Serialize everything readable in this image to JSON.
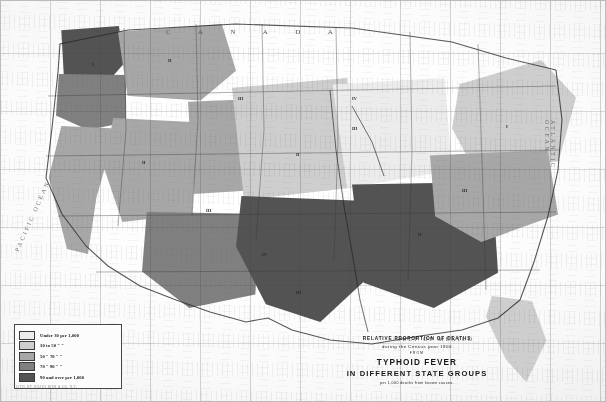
{
  "figure": {
    "kind": "choropleth-map",
    "region": "United States"
  },
  "title_block": {
    "line_relative": "RELATIVE PROPORTION OF DEATHS",
    "line_year": "during the Census year 1900",
    "line_from": "FROM",
    "disease": "TYPHOID FEVER",
    "subtitle": "IN DIFFERENT STATE GROUPS",
    "rate_note": "per 1,000 deaths from known causes."
  },
  "legend": {
    "items": [
      {
        "label": "Under 30 per 1,000",
        "color": "#eceae5"
      },
      {
        "label": "30 to 50    \"      \"",
        "color": "#cfccc5"
      },
      {
        "label": "50 \"  70    \"      \"",
        "color": "#aaa69e"
      },
      {
        "label": "70 \"  90    \"      \"",
        "color": "#84807a"
      },
      {
        "label": "90 and over per 1,000",
        "color": "#575450"
      }
    ]
  },
  "map_labels": {
    "canada": "C A N A D A",
    "atlantic": "ATLANTIC OCEAN",
    "pacific": "PACIFIC OCEAN",
    "gulf": "GULF OF MEXICO"
  },
  "state_groups": [
    {
      "numeral": "I",
      "x": 92,
      "y": 62
    },
    {
      "numeral": "II",
      "x": 168,
      "y": 58
    },
    {
      "numeral": "III",
      "x": 238,
      "y": 96
    },
    {
      "numeral": "IV",
      "x": 352,
      "y": 96
    },
    {
      "numeral": "III",
      "x": 352,
      "y": 126
    },
    {
      "numeral": "II",
      "x": 296,
      "y": 152
    },
    {
      "numeral": "II",
      "x": 142,
      "y": 160
    },
    {
      "numeral": "III",
      "x": 206,
      "y": 208
    },
    {
      "numeral": "IV",
      "x": 262,
      "y": 252
    },
    {
      "numeral": "III",
      "x": 296,
      "y": 290
    },
    {
      "numeral": "II",
      "x": 418,
      "y": 232
    },
    {
      "numeral": "III",
      "x": 462,
      "y": 188
    },
    {
      "numeral": "I",
      "x": 506,
      "y": 124
    }
  ],
  "imprint": "LITH. BY JULIUS BIEN & CO. N.Y.",
  "colors": {
    "class_1": "#eceae5",
    "class_2": "#cfccc5",
    "class_3": "#aaa69e",
    "class_4": "#84807a",
    "class_5": "#575450",
    "ink": "#1b1a19",
    "paper": "#f7f6f3"
  },
  "chart_data": {
    "type": "map",
    "title": "TYPHOID FEVER IN DIFFERENT STATE GROUPS",
    "subtitle": "RELATIVE PROPORTION OF DEATHS during the Census year 1900",
    "unit": "deaths from typhoid fever per 1,000 deaths from known causes",
    "classes": [
      {
        "range": "Under 30 per 1,000",
        "min": 0,
        "max": 30,
        "color": "#eceae5"
      },
      {
        "range": "30 to 50",
        "min": 30,
        "max": 50,
        "color": "#cfccc5"
      },
      {
        "range": "50 to 70",
        "min": 50,
        "max": 70,
        "color": "#aaa69e"
      },
      {
        "range": "70 to 90",
        "min": 70,
        "max": 90,
        "color": "#84807a"
      },
      {
        "range": "90 and over per 1,000",
        "min": 90,
        "max": null,
        "color": "#575450"
      }
    ],
    "regions": [
      {
        "name": "Washington",
        "class": 5
      },
      {
        "name": "Oregon",
        "class": 4
      },
      {
        "name": "California",
        "class": 3
      },
      {
        "name": "Idaho / Montana",
        "class": 3
      },
      {
        "name": "Nevada / Utah",
        "class": 3
      },
      {
        "name": "Wyoming / Colorado",
        "class": 3
      },
      {
        "name": "Arizona / New Mexico",
        "class": 4
      },
      {
        "name": "Great Plains",
        "class": 2
      },
      {
        "name": "Texas / Oklahoma",
        "class": 5
      },
      {
        "name": "Upper Midwest",
        "class": 1
      },
      {
        "name": "South Central",
        "class": 5
      },
      {
        "name": "New England",
        "class": 2
      },
      {
        "name": "Middle Atlantic",
        "class": 3
      },
      {
        "name": "Florida",
        "class": 2
      }
    ],
    "legend_position": "bottom-left",
    "grid": true
  }
}
